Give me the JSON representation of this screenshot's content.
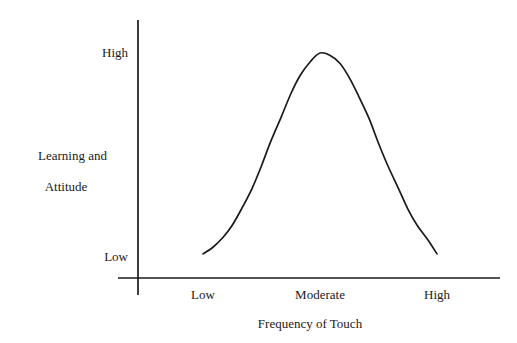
{
  "chart_data": {
    "type": "line",
    "title": "",
    "subtitle": "",
    "xlabel": "Frequency of Touch",
    "ylabel": "Learning and Attitude",
    "ylabel_line1": "Learning and",
    "ylabel_line2": "Attitude",
    "x_tick_labels": [
      "Low",
      "Moderate",
      "High"
    ],
    "y_tick_labels": [
      "Low",
      "High"
    ],
    "x_tick_values": [
      1,
      2,
      3
    ],
    "y_tick_values": [
      0,
      1
    ],
    "xlim": [
      0.6,
      3.4
    ],
    "ylim": [
      -0.12,
      1.12
    ],
    "grid": false,
    "legend": false,
    "legend_position": "none",
    "line_color": "#1a1a1a",
    "background_color": "#ffffff",
    "annotation": "Inverted-U relationship: learning and attitude peak at a moderate frequency of touch and fall off at both low and high frequency.",
    "series": [
      {
        "name": "Learning and Attitude",
        "x": [
          1.0,
          1.08,
          1.17,
          1.25,
          1.33,
          1.42,
          1.5,
          1.58,
          1.67,
          1.75,
          1.83,
          1.92,
          2.0,
          2.08,
          2.17,
          2.25,
          2.33,
          2.42,
          2.5,
          2.58,
          2.67,
          2.75,
          2.83,
          2.92,
          3.0
        ],
        "y": [
          0.02,
          0.05,
          0.1,
          0.16,
          0.24,
          0.34,
          0.45,
          0.57,
          0.69,
          0.8,
          0.89,
          0.96,
          1.0,
          0.99,
          0.95,
          0.88,
          0.79,
          0.68,
          0.56,
          0.45,
          0.34,
          0.24,
          0.16,
          0.09,
          0.02
        ]
      }
    ],
    "curve_pixels": {
      "start": [
        203,
        258
      ],
      "peak": [
        315,
        53
      ],
      "end": [
        437,
        258
      ]
    },
    "axes_pixels": {
      "y_axis_x": 138,
      "y_axis_top": 20,
      "y_axis_bottom": 295,
      "x_axis_y": 278,
      "x_axis_left": 118,
      "x_axis_right": 500
    }
  }
}
